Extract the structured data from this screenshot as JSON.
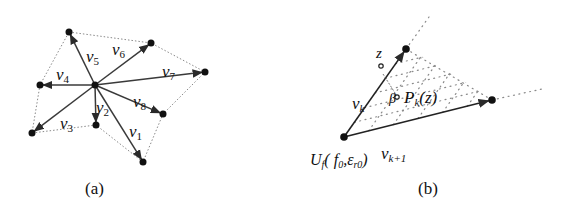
{
  "colors": {
    "arrow": "#3a3a3a",
    "node": "#111111",
    "dotted": "#8a8a8a",
    "background": "#ffffff"
  },
  "panel_a": {
    "caption": "(a)",
    "center": [
      95,
      85
    ],
    "vectors": [
      {
        "id": "v1",
        "label": "v",
        "sub": "1",
        "tip": [
          143,
          162
        ],
        "label_pos": [
          129,
          137
        ]
      },
      {
        "id": "v2",
        "label": "v",
        "sub": "2",
        "tip": [
          96,
          125
        ],
        "label_pos": [
          96,
          113
        ]
      },
      {
        "id": "v3",
        "label": "v",
        "sub": "3",
        "tip": [
          32,
          133
        ],
        "label_pos": [
          60,
          129
        ]
      },
      {
        "id": "v4",
        "label": "v",
        "sub": "4",
        "tip": [
          40,
          85
        ],
        "label_pos": [
          56,
          80
        ]
      },
      {
        "id": "v5",
        "label": "v",
        "sub": "5",
        "tip": [
          69,
          32
        ],
        "label_pos": [
          86,
          62
        ]
      },
      {
        "id": "v6",
        "label": "v",
        "sub": "6",
        "tip": [
          151,
          43
        ],
        "label_pos": [
          112,
          55
        ]
      },
      {
        "id": "v7",
        "label": "v",
        "sub": "7",
        "tip": [
          205,
          72
        ],
        "label_pos": [
          162,
          77
        ]
      },
      {
        "id": "v8",
        "label": "v",
        "sub": "8",
        "tip": [
          163,
          114
        ],
        "label_pos": [
          133,
          107
        ]
      }
    ],
    "hull_order": [
      "v5",
      "v6",
      "v7",
      "v8",
      "v1",
      "v2",
      "v3",
      "v4"
    ]
  },
  "panel_b": {
    "caption": "(b)",
    "origin": [
      344,
      137
    ],
    "origin_label": "U",
    "origin_label_sub": "f",
    "origin_label_args": "( f",
    "origin_label_args_sub0": "0",
    "origin_label_sep": ",",
    "origin_label_eps": "ε",
    "origin_label_eps_sub": "r0",
    "origin_label_close": ")",
    "vk": {
      "label": "v",
      "sub": "k",
      "tip": [
        406,
        49
      ]
    },
    "vk1": {
      "label": "v",
      "sub": "k+1",
      "tip": [
        492,
        100
      ]
    },
    "z": {
      "label": "z",
      "point": [
        381,
        66
      ]
    },
    "pk": {
      "label": "P",
      "sub": "k",
      "args": "(z)",
      "point": [
        397,
        97
      ]
    },
    "beta": {
      "label": "β"
    },
    "ray_ext_k": [
      429,
      17
    ],
    "ray_ext_k1": [
      542,
      89
    ]
  }
}
